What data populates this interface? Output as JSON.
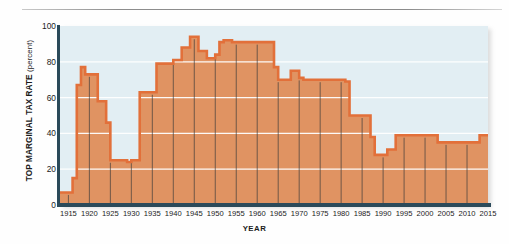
{
  "figure": {
    "has_top_rule": true,
    "plot_background": "#e2eef3",
    "area_fill": "#e09362",
    "area_stroke": "#e2703a",
    "axis_color": "#2b4a5a",
    "gridline_color": "#ffffff"
  },
  "axes": {
    "y_title_strong": "TOP MARGINAL TAX RATE",
    "y_title_light": "(percent)",
    "x_title": "YEAR",
    "y_ticks": [
      "0",
      "20",
      "40",
      "60",
      "80",
      "100"
    ],
    "x_ticks": [
      "1915",
      "1920",
      "1925",
      "1930",
      "1935",
      "1940",
      "1945",
      "1950",
      "1955",
      "1960",
      "1965",
      "1970",
      "1975",
      "1980",
      "1985",
      "1990",
      "1995",
      "2000",
      "2005",
      "2010",
      "2015"
    ]
  },
  "chart_data": {
    "type": "area",
    "title": "",
    "subtitle": "",
    "xlabel": "YEAR",
    "ylabel": "TOP MARGINAL TAX RATE (percent)",
    "xlim": [
      1913,
      2015
    ],
    "ylim": [
      0,
      100
    ],
    "grid": true,
    "grid_axis": "y",
    "legend": "none",
    "step_style": "post",
    "series": [
      {
        "name": "Top marginal tax rate",
        "x": [
          1913,
          1916,
          1917,
          1918,
          1919,
          1922,
          1924,
          1925,
          1929,
          1930,
          1932,
          1936,
          1940,
          1941,
          1942,
          1944,
          1946,
          1948,
          1950,
          1951,
          1952,
          1954,
          1964,
          1965,
          1968,
          1970,
          1971,
          1981,
          1982,
          1987,
          1988,
          1991,
          1993,
          2001,
          2003,
          2013,
          2015
        ],
        "values": [
          7,
          15,
          67,
          77,
          73,
          58,
          46,
          25,
          24,
          25,
          63,
          79,
          81,
          81,
          88,
          94,
          86,
          82,
          84,
          91,
          92,
          91,
          77,
          70,
          75,
          71,
          70,
          69,
          50,
          38,
          28,
          31,
          39,
          39,
          35,
          39,
          39
        ]
      }
    ],
    "annotations": []
  }
}
